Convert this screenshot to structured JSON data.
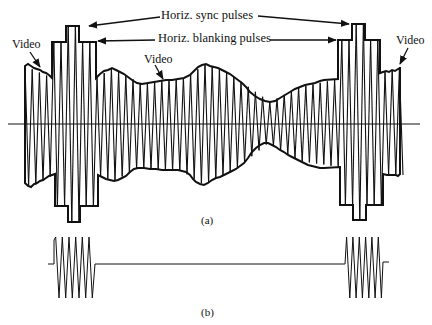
{
  "figure": {
    "labels": {
      "sync": "Horiz. sync pulses",
      "blanking": "Horiz. blanking pulses",
      "video_left": "Video",
      "video_center": "Video",
      "video_right": "Video",
      "caption_a": "(a)",
      "caption_b": "(b)"
    },
    "colors": {
      "ink": "#111111",
      "background": "#ffffff"
    }
  }
}
